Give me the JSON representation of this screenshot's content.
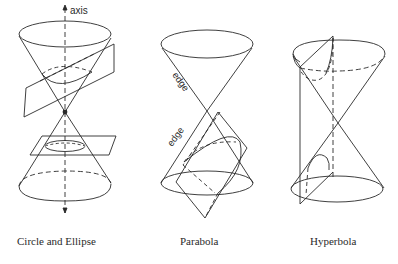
{
  "figures": [
    {
      "id": "circle-ellipse",
      "caption": "Circle and Ellipse",
      "annotations": {
        "axis_label": "axis"
      }
    },
    {
      "id": "parabola",
      "caption": "Parabola",
      "annotations": {
        "edge_label_upper": "edge",
        "edge_label_lower": "edge"
      }
    },
    {
      "id": "hyperbola",
      "caption": "Hyperbola",
      "annotations": {}
    }
  ],
  "style": {
    "stroke_color": "#2a2a2a",
    "background": "#ffffff"
  }
}
